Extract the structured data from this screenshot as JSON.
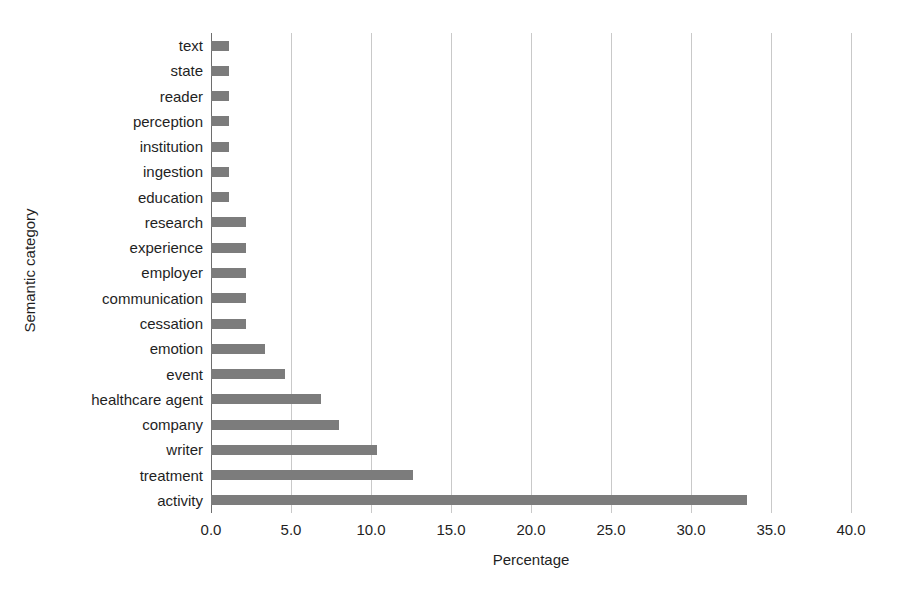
{
  "chart_data": {
    "type": "bar",
    "orientation": "horizontal",
    "title": "",
    "xlabel": "Percentage",
    "ylabel": "Semantic category",
    "xlim": [
      0.0,
      40.0
    ],
    "xticks": [
      "0.0",
      "5.0",
      "10.0",
      "15.0",
      "20.0",
      "25.0",
      "30.0",
      "35.0",
      "40.0"
    ],
    "xtick_values": [
      0.0,
      5.0,
      10.0,
      15.0,
      20.0,
      25.0,
      30.0,
      35.0,
      40.0
    ],
    "grid": "vertical",
    "legend": null,
    "bar_color": "#7c7c7c",
    "grid_color": "#c9c9c9",
    "categories": [
      "text",
      "state",
      "reader",
      "perception",
      "institution",
      "ingestion",
      "education",
      "research",
      "experience",
      "employer",
      "communication",
      "cessation",
      "emotion",
      "event",
      "healthcare agent",
      "company",
      "writer",
      "treatment",
      "activity"
    ],
    "values": [
      1.1,
      1.1,
      1.1,
      1.1,
      1.1,
      1.1,
      1.1,
      2.2,
      2.2,
      2.2,
      2.2,
      2.2,
      3.4,
      4.6,
      6.9,
      8.0,
      10.4,
      12.6,
      33.5
    ]
  }
}
